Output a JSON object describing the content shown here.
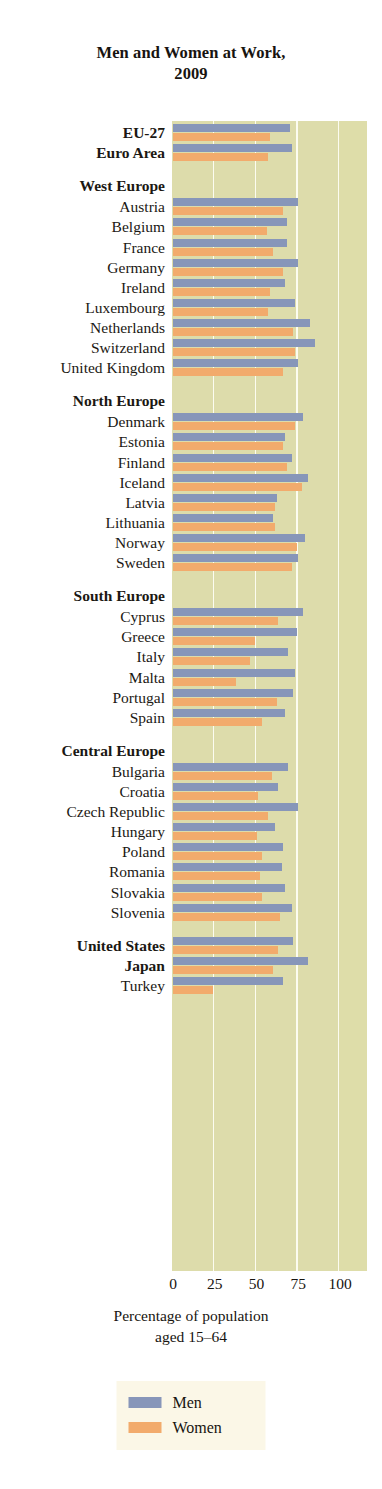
{
  "title": {
    "line1": "Men and Women at Work,",
    "line2": "2009"
  },
  "axis": {
    "caption_line1": "Percentage of population",
    "caption_line2": "aged 15–64",
    "ticks": [
      "0",
      "25",
      "50",
      "75",
      "100"
    ]
  },
  "legend": {
    "men_label": "Men",
    "women_label": "Women",
    "men_color": "#8796b9",
    "women_color": "#f2ab6c",
    "background": "#fbf7e7"
  },
  "colors": {
    "plot_background": "#dddcab",
    "gridline": "#fdfdf3",
    "page_background": "#ffffff",
    "text": "#171410"
  },
  "chart_data": {
    "type": "bar",
    "orientation": "horizontal",
    "title": "Men and Women at Work, 2009",
    "xlabel": "Percentage of population aged 15–64",
    "ylabel": "",
    "xlim": [
      0,
      100
    ],
    "xticks": [
      0,
      25,
      50,
      75,
      100
    ],
    "grid": true,
    "legend_position": "bottom",
    "series": [
      {
        "name": "Men",
        "color": "#8796b9"
      },
      {
        "name": "Women",
        "color": "#f2ab6c"
      }
    ],
    "rows": [
      {
        "label": "EU-27",
        "kind": "bold",
        "men": 70,
        "women": 58
      },
      {
        "label": "Euro Area",
        "kind": "bold",
        "men": 71,
        "women": 57
      },
      {
        "label": "West Europe",
        "kind": "group"
      },
      {
        "label": "Austria",
        "kind": "item",
        "men": 75,
        "women": 66
      },
      {
        "label": "Belgium",
        "kind": "item",
        "men": 68,
        "women": 56
      },
      {
        "label": "France",
        "kind": "item",
        "men": 68,
        "women": 60
      },
      {
        "label": "Germany",
        "kind": "item",
        "men": 75,
        "women": 66
      },
      {
        "label": "Ireland",
        "kind": "item",
        "men": 67,
        "women": 58
      },
      {
        "label": "Luxembourg",
        "kind": "item",
        "men": 73,
        "women": 57
      },
      {
        "label": "Netherlands",
        "kind": "item",
        "men": 82,
        "women": 72
      },
      {
        "label": "Switzerland",
        "kind": "item",
        "men": 85,
        "women": 73
      },
      {
        "label": "United Kingdom",
        "kind": "item",
        "men": 75,
        "women": 66
      },
      {
        "label": "North Europe",
        "kind": "group"
      },
      {
        "label": "Denmark",
        "kind": "item",
        "men": 78,
        "women": 73
      },
      {
        "label": "Estonia",
        "kind": "item",
        "men": 67,
        "women": 66
      },
      {
        "label": "Finland",
        "kind": "item",
        "men": 71,
        "women": 68
      },
      {
        "label": "Iceland",
        "kind": "item",
        "men": 81,
        "women": 77
      },
      {
        "label": "Latvia",
        "kind": "item",
        "men": 62,
        "women": 61
      },
      {
        "label": "Lithuania",
        "kind": "item",
        "men": 60,
        "women": 61
      },
      {
        "label": "Norway",
        "kind": "item",
        "men": 79,
        "women": 74
      },
      {
        "label": "Sweden",
        "kind": "item",
        "men": 75,
        "women": 71
      },
      {
        "label": "South Europe",
        "kind": "group"
      },
      {
        "label": "Cyprus",
        "kind": "item",
        "men": 78,
        "women": 63
      },
      {
        "label": "Greece",
        "kind": "item",
        "men": 74,
        "women": 49
      },
      {
        "label": "Italy",
        "kind": "item",
        "men": 69,
        "women": 46
      },
      {
        "label": "Malta",
        "kind": "item",
        "men": 73,
        "women": 38
      },
      {
        "label": "Portugal",
        "kind": "item",
        "men": 72,
        "women": 62
      },
      {
        "label": "Spain",
        "kind": "item",
        "men": 67,
        "women": 53
      },
      {
        "label": "Central Europe",
        "kind": "group"
      },
      {
        "label": "Bulgaria",
        "kind": "item",
        "men": 69,
        "women": 59
      },
      {
        "label": "Croatia",
        "kind": "item",
        "men": 63,
        "women": 51
      },
      {
        "label": "Czech Republic",
        "kind": "item",
        "men": 75,
        "women": 57
      },
      {
        "label": "Hungary",
        "kind": "item",
        "men": 61,
        "women": 50
      },
      {
        "label": "Poland",
        "kind": "item",
        "men": 66,
        "women": 53
      },
      {
        "label": "Romania",
        "kind": "item",
        "men": 65,
        "women": 52
      },
      {
        "label": "Slovakia",
        "kind": "item",
        "men": 67,
        "women": 53
      },
      {
        "label": "Slovenia",
        "kind": "item",
        "men": 71,
        "women": 64
      },
      {
        "label": "United States",
        "kind": "bold",
        "men": 72,
        "women": 63
      },
      {
        "label": "Japan",
        "kind": "bold",
        "men": 81,
        "women": 60
      },
      {
        "label": "Turkey",
        "kind": "item",
        "men": 66,
        "women": 24
      }
    ]
  }
}
